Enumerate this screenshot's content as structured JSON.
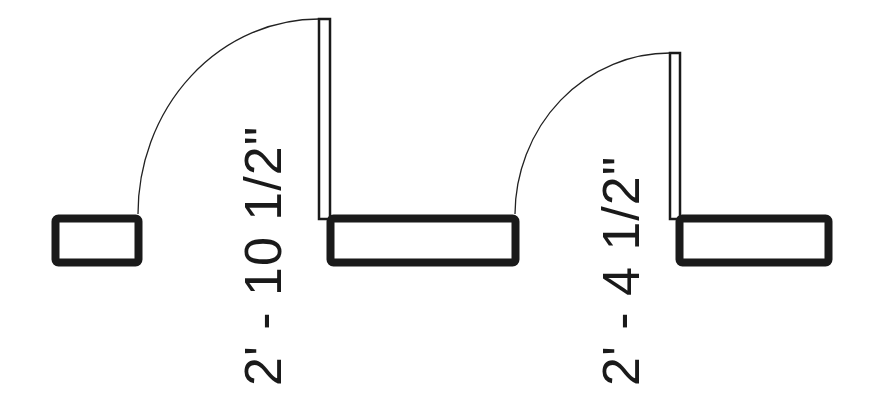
{
  "diagram": {
    "type": "architectural floor plan - door openings",
    "colors": {
      "background": "#ffffff",
      "stroke": "#1a1a1a"
    },
    "doors": [
      {
        "id": "door-1",
        "width_label": "2' - 10 1/2\"",
        "swing": "quarter-arc"
      },
      {
        "id": "door-2",
        "width_label": "2' - 4 1/2\"",
        "swing": "quarter-arc"
      }
    ],
    "walls": [
      {
        "id": "wall-left"
      },
      {
        "id": "wall-middle"
      },
      {
        "id": "wall-right"
      }
    ]
  }
}
